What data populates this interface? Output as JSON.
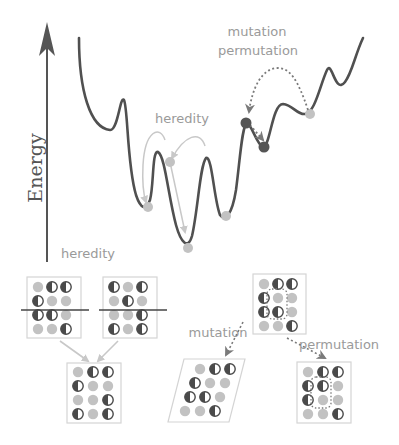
{
  "colors": {
    "curve": "#505050",
    "axis": "#555555",
    "light_arrow": "#c8c8c8",
    "dotted_arrow": "#7a7a7a",
    "light_atom": "#c2c2c2",
    "dark_atom": "#4a4a4a",
    "dark_dot": "#555555",
    "box_border": "#d4d4d4",
    "label": "#9a9a9a"
  },
  "axis": {
    "label": "Energy"
  },
  "labels": {
    "heredity_top": "heredity",
    "mutation_top": "mutation",
    "permutation_top": "permutation",
    "heredity_bottom": "heredity",
    "mutation_bottom": "mutation",
    "permutation_bottom": "permutation"
  },
  "structures": {
    "parent_a": [
      [
        "L",
        "H",
        "H"
      ],
      [
        "H",
        "L",
        "L"
      ],
      [
        "H",
        "H",
        "L"
      ],
      [
        "L",
        "L",
        "H"
      ]
    ],
    "parent_b": [
      [
        "H",
        "L",
        "H"
      ],
      [
        "L",
        "H",
        "L"
      ],
      [
        "L",
        "L",
        "H"
      ],
      [
        "H",
        "L",
        "H"
      ]
    ],
    "child": [
      [
        "L",
        "H",
        "H"
      ],
      [
        "H",
        "L",
        "L"
      ],
      [
        "L",
        "L",
        "H"
      ],
      [
        "H",
        "L",
        "H"
      ]
    ],
    "source": [
      [
        "L",
        "H",
        "H"
      ],
      [
        "H",
        "L",
        "L"
      ],
      [
        "H",
        "H",
        "L"
      ],
      [
        "L",
        "L",
        "H"
      ]
    ],
    "mutated": [
      [
        "L",
        "H",
        "H"
      ],
      [
        "H",
        "L",
        "L"
      ],
      [
        "H",
        "H",
        "L"
      ],
      [
        "L",
        "L",
        "H"
      ]
    ],
    "permuted": [
      [
        "L",
        "H",
        "H"
      ],
      [
        "H",
        "H",
        "L"
      ],
      [
        "H",
        "L",
        "L"
      ],
      [
        "L",
        "L",
        "H"
      ]
    ]
  }
}
